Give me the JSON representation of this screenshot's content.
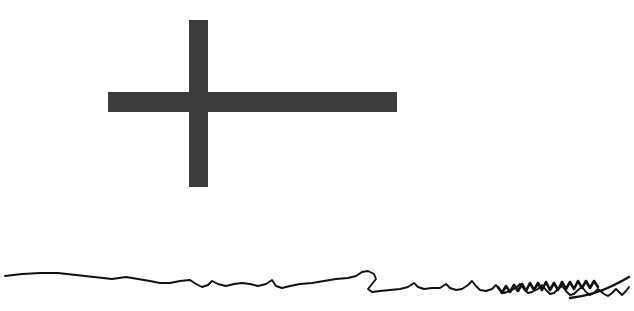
{
  "canvas": {
    "width": 634,
    "height": 311,
    "background_color": "#ffffff",
    "title": "Canvas Sketch"
  },
  "marks": {
    "cross": {
      "name": "plus-cross-mark",
      "color": "#3c3c3c",
      "vertical_bar": {
        "x": 189,
        "y": 20,
        "width": 19,
        "height": 167
      },
      "horizontal_bar": {
        "x": 108,
        "y": 92,
        "width": 289,
        "height": 20
      },
      "center_x": 198,
      "center_y": 102
    },
    "squiggle": {
      "name": "wavy-ink-stroke",
      "color": "#111111",
      "stroke_width": 1.9,
      "start_x": 5,
      "start_y": 276,
      "end_x": 629,
      "end_y": 287,
      "path": "M5,276 L22,274 L40,273 L58,273 L76,275 L94,277 L112,279 L126,277 L138,279 L150,281 L160,283 L170,283 L180,281 L190,280 L196,284 L202,287 L208,285 L212,281 L218,284 L226,286 L234,284 L242,283 L250,284 L258,286 L266,284 L272,280 L276,286 L282,288 L290,286 L300,284 L312,283 L324,281 L336,279 L348,278 L356,276 L362,272 L368,271 L374,274 L376,279 L372,284 L368,289 L372,292 L380,291 L390,290 L400,289 L408,287 L414,283 L418,287 L424,289 L432,288 L440,288 L446,284 L450,288 L456,290 L462,289 L468,285 L472,281 L476,286 L480,290 L486,291 L492,289 L496,285 L500,290 L504,293 L510,291 L516,288 L520,284 L524,289 L528,293 L532,292 L538,289 L542,285 L546,290 L550,294 L554,293 L558,289 L562,286 L566,291 L570,295 L574,294 L578,290 L582,287 L586,292 L590,295 L594,293 L598,289 L604,294 L608,296 L612,293 L616,289 L620,293 L622,295 L626,291 L629,287",
      "dense_zigzag": {
        "start_x": 498,
        "end_x": 600,
        "path": "M498,287 L502,293 L506,286 L510,292 L514,285 L518,291 L522,284 L526,291 L530,283 L534,290 L538,283 L542,290 L546,282 L550,290 L554,283 L558,290 L562,282 L566,289 L570,282 L574,289 L578,281 L582,288 L586,281 L590,288 L594,281 L598,287"
      },
      "tail": {
        "path": "M570,298 C586,296 600,292 612,286 C620,282 626,279 629,277"
      }
    }
  }
}
